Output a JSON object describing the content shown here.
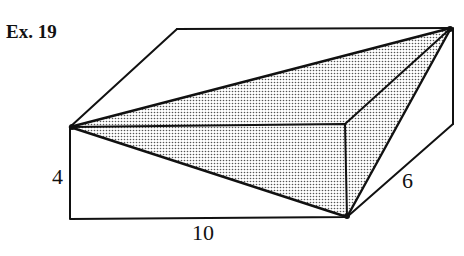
{
  "figure": {
    "title": "Ex. 19",
    "dimensions": {
      "height": "4",
      "length": "10",
      "depth": "6"
    },
    "colors": {
      "line": "#111111",
      "shade_dot": "#555555",
      "background": "#ffffff"
    }
  }
}
